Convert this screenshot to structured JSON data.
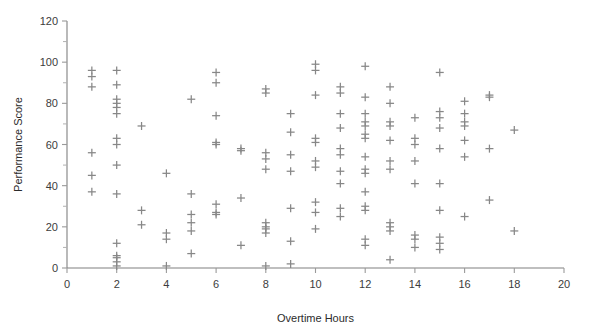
{
  "chart_data": {
    "type": "scatter",
    "title": "",
    "xlabel": "Overtime Hours",
    "ylabel": "Performance Score",
    "xlim": [
      0,
      20
    ],
    "ylim": [
      0,
      120
    ],
    "xticks": [
      0,
      2,
      4,
      6,
      8,
      10,
      12,
      14,
      16,
      18,
      20
    ],
    "yticks": [
      0,
      20,
      40,
      60,
      80,
      100,
      120
    ],
    "x_minor_step": 1,
    "y_minor_step": 10,
    "grid": false,
    "legend": null,
    "marker": "plus",
    "marker_color": "#878787",
    "axis_color": "#808080",
    "points": [
      [
        1,
        96
      ],
      [
        1,
        93
      ],
      [
        1,
        88
      ],
      [
        1,
        56
      ],
      [
        1,
        45
      ],
      [
        1,
        37
      ],
      [
        2,
        96
      ],
      [
        2,
        89
      ],
      [
        2,
        82
      ],
      [
        2,
        80
      ],
      [
        2,
        78
      ],
      [
        2,
        75
      ],
      [
        2,
        63
      ],
      [
        2,
        60
      ],
      [
        2,
        50
      ],
      [
        2,
        36
      ],
      [
        2,
        12
      ],
      [
        2,
        6
      ],
      [
        2,
        5
      ],
      [
        2,
        3
      ],
      [
        2,
        1
      ],
      [
        3,
        69
      ],
      [
        3,
        28
      ],
      [
        3,
        21
      ],
      [
        4,
        46
      ],
      [
        4,
        17
      ],
      [
        4,
        14
      ],
      [
        4,
        1
      ],
      [
        5,
        82
      ],
      [
        5,
        36
      ],
      [
        5,
        26
      ],
      [
        5,
        22
      ],
      [
        5,
        18
      ],
      [
        5,
        7
      ],
      [
        6,
        95
      ],
      [
        6,
        90
      ],
      [
        6,
        74
      ],
      [
        6,
        61
      ],
      [
        6,
        60
      ],
      [
        6,
        31
      ],
      [
        6,
        27
      ],
      [
        6,
        26
      ],
      [
        7,
        58
      ],
      [
        7,
        57
      ],
      [
        7,
        34
      ],
      [
        7,
        11
      ],
      [
        8,
        87
      ],
      [
        8,
        85
      ],
      [
        8,
        56
      ],
      [
        8,
        53
      ],
      [
        8,
        48
      ],
      [
        8,
        22
      ],
      [
        8,
        20
      ],
      [
        8,
        19
      ],
      [
        8,
        17
      ],
      [
        8,
        1
      ],
      [
        9,
        75
      ],
      [
        9,
        66
      ],
      [
        9,
        55
      ],
      [
        9,
        47
      ],
      [
        9,
        29
      ],
      [
        9,
        13
      ],
      [
        9,
        2
      ],
      [
        10,
        99
      ],
      [
        10,
        96
      ],
      [
        10,
        84
      ],
      [
        10,
        63
      ],
      [
        10,
        61
      ],
      [
        10,
        52
      ],
      [
        10,
        49
      ],
      [
        10,
        32
      ],
      [
        10,
        27
      ],
      [
        10,
        19
      ],
      [
        11,
        88
      ],
      [
        11,
        85
      ],
      [
        11,
        75
      ],
      [
        11,
        68
      ],
      [
        11,
        58
      ],
      [
        11,
        55
      ],
      [
        11,
        47
      ],
      [
        11,
        41
      ],
      [
        11,
        29
      ],
      [
        11,
        25
      ],
      [
        12,
        98
      ],
      [
        12,
        83
      ],
      [
        12,
        75
      ],
      [
        12,
        71
      ],
      [
        12,
        69
      ],
      [
        12,
        65
      ],
      [
        12,
        63
      ],
      [
        12,
        54
      ],
      [
        12,
        48
      ],
      [
        12,
        46
      ],
      [
        12,
        37
      ],
      [
        12,
        30
      ],
      [
        12,
        28
      ],
      [
        12,
        14
      ],
      [
        12,
        11
      ],
      [
        13,
        88
      ],
      [
        13,
        80
      ],
      [
        13,
        71
      ],
      [
        13,
        69
      ],
      [
        13,
        62
      ],
      [
        13,
        52
      ],
      [
        13,
        48
      ],
      [
        13,
        22
      ],
      [
        13,
        20
      ],
      [
        13,
        18
      ],
      [
        13,
        4
      ],
      [
        14,
        73
      ],
      [
        14,
        63
      ],
      [
        14,
        60
      ],
      [
        14,
        52
      ],
      [
        14,
        41
      ],
      [
        14,
        16
      ],
      [
        14,
        14
      ],
      [
        14,
        10
      ],
      [
        15,
        95
      ],
      [
        15,
        76
      ],
      [
        15,
        73
      ],
      [
        15,
        68
      ],
      [
        15,
        58
      ],
      [
        15,
        41
      ],
      [
        15,
        28
      ],
      [
        15,
        15
      ],
      [
        15,
        12
      ],
      [
        15,
        9
      ],
      [
        16,
        81
      ],
      [
        16,
        75
      ],
      [
        16,
        71
      ],
      [
        16,
        69
      ],
      [
        16,
        62
      ],
      [
        16,
        54
      ],
      [
        16,
        25
      ],
      [
        17,
        84
      ],
      [
        17,
        83
      ],
      [
        17,
        58
      ],
      [
        17,
        33
      ],
      [
        18,
        67
      ],
      [
        18,
        18
      ]
    ]
  },
  "axes": {
    "y_label": "Performance Score",
    "x_label": "Overtime Hours",
    "y_tick_labels": [
      "0",
      "20",
      "40",
      "60",
      "80",
      "100",
      "120"
    ],
    "x_tick_labels": [
      "0",
      "2",
      "4",
      "6",
      "8",
      "10",
      "12",
      "14",
      "16",
      "18",
      "20"
    ]
  }
}
